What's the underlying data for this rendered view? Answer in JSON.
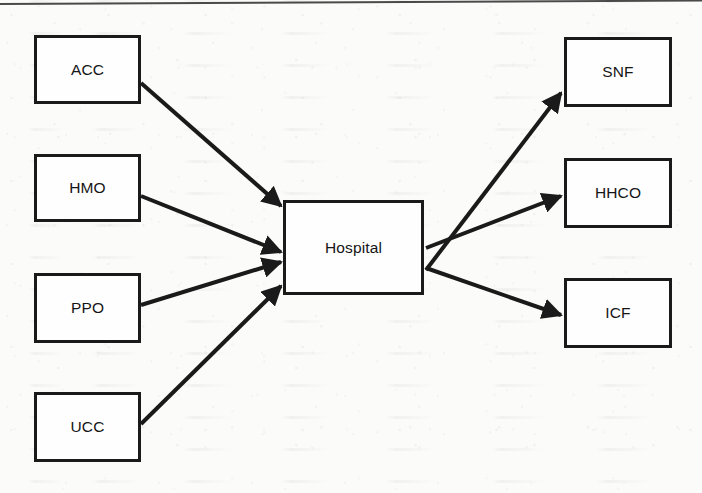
{
  "figure": {
    "kind": "flow-diagram",
    "orientation": "left-to-right",
    "hub": "Hospital",
    "background_color": "#fbfbfa",
    "line_color": "#1a1a1a",
    "text_color": "#151515"
  },
  "nodes": [
    {
      "id": "acc",
      "label": "ACC",
      "column": "left",
      "x": 34,
      "y": 35,
      "w": 107,
      "h": 69
    },
    {
      "id": "hmo",
      "label": "HMO",
      "column": "left",
      "x": 34,
      "y": 154,
      "w": 107,
      "h": 68
    },
    {
      "id": "ppo",
      "label": "PPO",
      "column": "left",
      "x": 34,
      "y": 273,
      "w": 107,
      "h": 70
    },
    {
      "id": "ucc",
      "label": "UCC",
      "column": "left",
      "x": 34,
      "y": 392,
      "w": 107,
      "h": 70
    },
    {
      "id": "hospital",
      "label": "Hospital",
      "column": "center",
      "x": 283,
      "y": 200,
      "w": 141,
      "h": 95
    },
    {
      "id": "snf",
      "label": "SNF",
      "column": "right",
      "x": 564,
      "y": 37,
      "w": 108,
      "h": 70
    },
    {
      "id": "hhco",
      "label": "HHCO",
      "column": "right",
      "x": 564,
      "y": 158,
      "w": 108,
      "h": 70
    },
    {
      "id": "icf",
      "label": "ICF",
      "column": "right",
      "x": 564,
      "y": 278,
      "w": 108,
      "h": 70
    }
  ],
  "edges": [
    {
      "id": "acc-to-hospital",
      "from": "acc",
      "to": "hospital",
      "x1": 141,
      "y1": 83,
      "x2": 281,
      "y2": 206
    },
    {
      "id": "hmo-to-hospital",
      "from": "hmo",
      "to": "hospital",
      "x1": 141,
      "y1": 196,
      "x2": 281,
      "y2": 252
    },
    {
      "id": "ppo-to-hospital",
      "from": "ppo",
      "to": "hospital",
      "x1": 141,
      "y1": 305,
      "x2": 281,
      "y2": 262
    },
    {
      "id": "ucc-to-hospital",
      "from": "ucc",
      "to": "hospital",
      "x1": 141,
      "y1": 424,
      "x2": 281,
      "y2": 286
    },
    {
      "id": "hospital-to-snf",
      "from": "hospital",
      "to": "snf",
      "x1": 426,
      "y1": 270,
      "x2": 561,
      "y2": 93
    },
    {
      "id": "hospital-to-hhco",
      "from": "hospital",
      "to": "hhco",
      "x1": 426,
      "y1": 248,
      "x2": 561,
      "y2": 196
    },
    {
      "id": "hospital-to-icf",
      "from": "hospital",
      "to": "icf",
      "x1": 426,
      "y1": 268,
      "x2": 561,
      "y2": 315
    }
  ]
}
